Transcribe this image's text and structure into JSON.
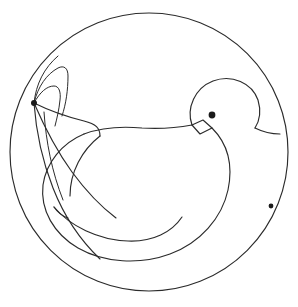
{
  "artwork": {
    "title": "Bird in circle line drawing",
    "type": "line-art-illustration",
    "subject": "bird",
    "background_color": "#ffffff",
    "stroke_color": "#2b2b2b",
    "dot_color": "#1a1a1a",
    "canvas": {
      "width": 298,
      "height": 307
    }
  },
  "chart_data": {
    "type": "scatter",
    "title": "Bird in circle line drawing",
    "xlabel": "",
    "ylabel": "",
    "xlim": [
      0,
      298
    ],
    "ylim": [
      0,
      307
    ],
    "grid": false,
    "legend": "none",
    "annotations": [
      "outer circle enclosing the whole composition",
      "bird head at upper right with round eye",
      "small diamond-shaped beak",
      "large rounded body occupying the centre",
      "wing sweeping down and left ending in a hook",
      "tail feathers converging at a marked point on the left",
      "marker dot on the right edge of the circle"
    ]
  },
  "shapes": {
    "outer_circle": {
      "name": "outer-circle",
      "center_x": 149,
      "center_y": 152,
      "radius": 139
    },
    "eye": {
      "name": "bird-eye",
      "cx": 212,
      "cy": 115,
      "r": 3.4
    },
    "tail_node": {
      "name": "tail-convergence-point",
      "cx": 34,
      "cy": 103,
      "r": 3.0
    },
    "edge_marker": {
      "name": "circle-edge-marker",
      "cx": 271,
      "cy": 206,
      "r": 2.4
    },
    "beak": {
      "name": "bird-beak",
      "points": "192,125 203,120 212,128 200,134"
    },
    "head": {
      "name": "bird-head",
      "path": "M 192,125 C 186,108 195,88 213,81 C 232,74 252,83 258,100 C 261,110 260,120 255,128"
    },
    "back_to_edge": {
      "name": "bird-back-upper",
      "path": "M 255,128 C 263,132 272,134 280,134"
    },
    "neck_front": {
      "name": "bird-neck-front",
      "path": "M 192,125 C 176,128 160,129 142,128 C 120,126 100,128 84,134"
    },
    "body_outline": {
      "name": "bird-body-outline",
      "path": "M 84,134 C 62,143 46,163 43,185 C 40,210 54,234 78,248 C 104,263 140,265 170,254 C 200,243 222,218 228,190 C 233,166 228,144 212,128"
    },
    "wing_curve": {
      "name": "bird-wing-curve",
      "path": "M 54,207 C 70,226 98,240 128,241 C 153,242 172,232 182,217"
    },
    "wing_hook": {
      "name": "bird-wing-hook-tip",
      "path": "M 54,207 C 58,213 62,216 68,218"
    },
    "tail_feather_1": {
      "name": "tail-feather-outer",
      "path": "M 34,103 C 36,84 44,68 58,56"
    },
    "tail_feather_2": {
      "name": "tail-feather-middle",
      "path": "M 34,103 C 38,86 47,74 58,68 C 64,65 68,68 68,76 C 68,90 66,104 62,116"
    },
    "tail_feather_3": {
      "name": "tail-feather-inner",
      "path": "M 34,103 C 40,92 47,86 54,86 C 59,86 61,92 60,100 C 59,110 57,118 55,126"
    },
    "tail_edge_1": {
      "name": "tail-underside-upper",
      "path": "M 34,103 C 48,110 64,116 84,121 C 96,124 100,128 100,136"
    },
    "tail_edge_2": {
      "name": "tail-underside-lower",
      "path": "M 34,103 C 44,126 56,150 72,172 C 86,191 100,206 116,218"
    },
    "tail_edge_3": {
      "name": "tail-underside-outer",
      "path": "M 34,103 C 36,131 42,160 53,188 C 64,216 80,240 100,259"
    },
    "tail_edge_4": {
      "name": "tail-underside-inner",
      "path": "M 44,112 C 46,142 52,172 63,200"
    },
    "breast_arc": {
      "name": "bird-breast-arc",
      "path": "M 100,136 C 82,150 70,172 70,196"
    }
  }
}
